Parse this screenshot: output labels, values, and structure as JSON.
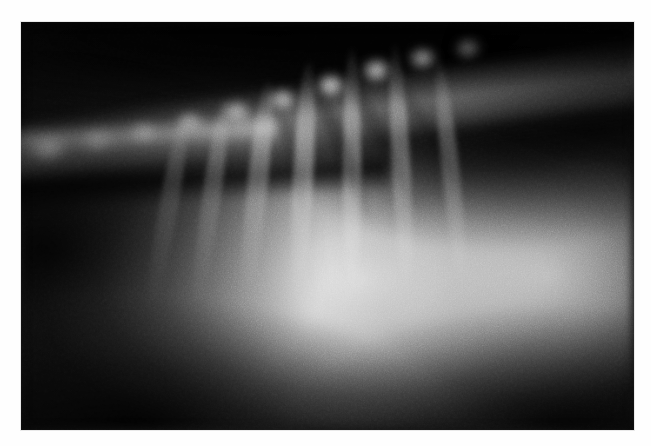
{
  "image": {
    "kind": "radiograph",
    "modality": "X-ray",
    "view": "lateral thorax",
    "subject": "animal thorax",
    "alt_text": "Lateral thoracic radiograph showing the vertebral column running across the upper field, a large bright pulmonary opacity occupying the central and caudoventral thorax, a dark aerated lung field dorsocaudally, and faint rib shadows.",
    "caption": "",
    "width_px": 651,
    "height_px": 446
  },
  "plate": {
    "left_px": 21,
    "top_px": 22,
    "width_px": 613,
    "height_px": 408,
    "border_color": "#fefefe",
    "background_color": "#050505"
  },
  "palette": {
    "paper_white": "#fefefe",
    "film_black": "#050505",
    "fog_dark": "#191919",
    "mid_grey": "#6e6e6e",
    "bone_grey": "#b4b4b4",
    "opacity_white": "#f1f1f1"
  },
  "anatomy": {
    "regions": [
      {
        "name": "vertebral-column",
        "label": "Vertebral column",
        "brightness": "bright",
        "location": "upper band, sloping down to the left"
      },
      {
        "name": "dorsal-lung-field",
        "label": "Dorsal lung field",
        "brightness": "dark",
        "location": "upper right"
      },
      {
        "name": "pulmonary-opacity",
        "label": "Pulmonary opacity",
        "brightness": "very bright",
        "location": "centre and caudoventral"
      },
      {
        "name": "diaphragm-dome",
        "label": "Diaphragm / liver dome",
        "brightness": "bright",
        "location": "right mid"
      },
      {
        "name": "rib-shadows",
        "label": "Rib shadows",
        "brightness": "faint",
        "location": "fanning ventrally"
      },
      {
        "name": "soft-tissue-shadow",
        "label": "Soft tissue shadow",
        "brightness": "dark",
        "location": "left and lower corners"
      }
    ],
    "vertebrae": [
      {
        "x_pct": 4.5,
        "y_pct": 31.0,
        "w_pct": 8.0,
        "h_pct": 9.0,
        "intensity": 0.58
      },
      {
        "x_pct": 12.5,
        "y_pct": 29.0,
        "w_pct": 7.0,
        "h_pct": 8.0,
        "intensity": 0.4
      },
      {
        "x_pct": 20.0,
        "y_pct": 27.0,
        "w_pct": 6.0,
        "h_pct": 7.5,
        "intensity": 0.44
      },
      {
        "x_pct": 27.5,
        "y_pct": 24.5,
        "w_pct": 6.0,
        "h_pct": 7.5,
        "intensity": 0.52
      },
      {
        "x_pct": 35.0,
        "y_pct": 22.0,
        "w_pct": 6.2,
        "h_pct": 7.8,
        "intensity": 0.56
      },
      {
        "x_pct": 42.5,
        "y_pct": 19.0,
        "w_pct": 6.2,
        "h_pct": 7.8,
        "intensity": 0.62
      },
      {
        "x_pct": 50.5,
        "y_pct": 15.5,
        "w_pct": 6.4,
        "h_pct": 8.0,
        "intensity": 0.7
      },
      {
        "x_pct": 58.0,
        "y_pct": 12.0,
        "w_pct": 6.4,
        "h_pct": 8.2,
        "intensity": 0.66
      },
      {
        "x_pct": 65.5,
        "y_pct": 9.0,
        "w_pct": 6.0,
        "h_pct": 7.6,
        "intensity": 0.5
      },
      {
        "x_pct": 73.0,
        "y_pct": 6.5,
        "w_pct": 5.6,
        "h_pct": 7.0,
        "intensity": 0.34
      }
    ],
    "ribs": [
      {
        "x_pct": 24.0,
        "y_pct": 46.0,
        "w_pct": 3.0,
        "h_pct": 50.0,
        "rot_deg": 10,
        "intensity": 0.26
      },
      {
        "x_pct": 31.0,
        "y_pct": 44.0,
        "w_pct": 3.0,
        "h_pct": 52.0,
        "rot_deg": 8,
        "intensity": 0.3
      },
      {
        "x_pct": 38.5,
        "y_pct": 41.0,
        "w_pct": 3.2,
        "h_pct": 55.0,
        "rot_deg": 6,
        "intensity": 0.34
      },
      {
        "x_pct": 46.0,
        "y_pct": 38.0,
        "w_pct": 3.2,
        "h_pct": 58.0,
        "rot_deg": 3,
        "intensity": 0.38
      },
      {
        "x_pct": 54.0,
        "y_pct": 36.0,
        "w_pct": 3.0,
        "h_pct": 60.0,
        "rot_deg": 0,
        "intensity": 0.34
      },
      {
        "x_pct": 62.0,
        "y_pct": 35.0,
        "w_pct": 3.0,
        "h_pct": 60.0,
        "rot_deg": -3,
        "intensity": 0.3
      },
      {
        "x_pct": 70.0,
        "y_pct": 36.0,
        "w_pct": 2.8,
        "h_pct": 56.0,
        "rot_deg": -6,
        "intensity": 0.24
      }
    ],
    "rib_shadows_dark": [
      {
        "x_pct": 52.0,
        "y_pct": 30.0,
        "w_pct": 2.6,
        "h_pct": 44.0,
        "rot_deg": -22,
        "intensity": 0.4
      },
      {
        "x_pct": 58.5,
        "y_pct": 28.0,
        "w_pct": 2.4,
        "h_pct": 46.0,
        "rot_deg": -26,
        "intensity": 0.34
      },
      {
        "x_pct": 66.0,
        "y_pct": 26.0,
        "w_pct": 2.2,
        "h_pct": 42.0,
        "rot_deg": -30,
        "intensity": 0.26
      },
      {
        "x_pct": 44.0,
        "y_pct": 32.0,
        "w_pct": 2.2,
        "h_pct": 38.0,
        "rot_deg": -14,
        "intensity": 0.22
      }
    ]
  }
}
